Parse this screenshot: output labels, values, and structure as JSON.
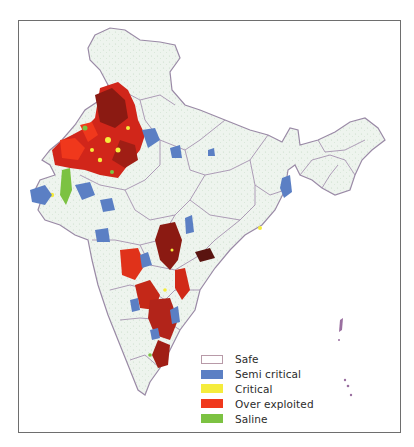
{
  "map": {
    "subject": "India groundwater development categories",
    "base_fill": "#eef4ee",
    "border_color": "#9a8aa6",
    "frame_color": "#6e6e6e"
  },
  "legend": {
    "items": [
      {
        "label": "Safe",
        "color": "#ffffff",
        "border": "#b89aa8"
      },
      {
        "label": "Semi critical",
        "color": "#5b7fc4",
        "border": "#5b7fc4"
      },
      {
        "label": "Critical",
        "color": "#f5ec3c",
        "border": "#f5ec3c"
      },
      {
        "label": "Over exploited",
        "color": "#f0381c",
        "border": "#f0381c"
      },
      {
        "label": "Saline",
        "color": "#7cc242",
        "border": "#7cc242"
      }
    ]
  }
}
